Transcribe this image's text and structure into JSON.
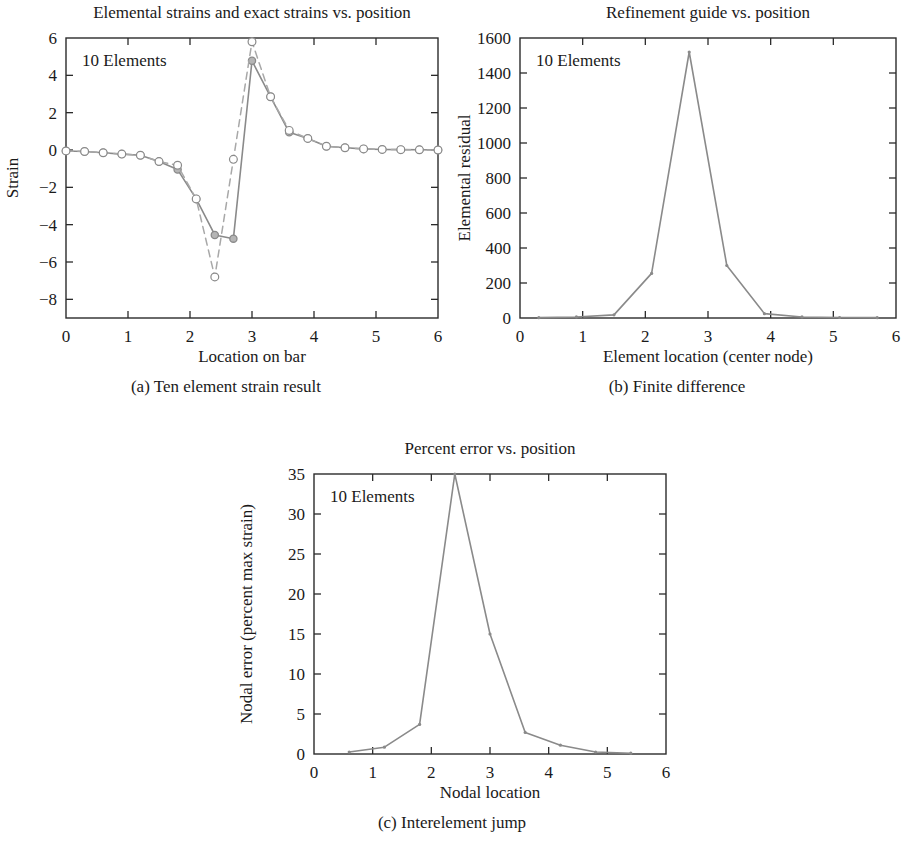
{
  "figure": {
    "panels": [
      {
        "id": "a",
        "title": "Elemental strains and exact strains vs. position",
        "annotation": "10 Elements",
        "xlabel": "Location on bar",
        "ylabel": "Strain",
        "caption": "(a) Ten element strain result"
      },
      {
        "id": "b",
        "title": "Refinement guide vs. position",
        "annotation": "10 Elements",
        "xlabel": "Element location (center node)",
        "ylabel": "Elemental residual",
        "caption": "(b) Finite difference"
      },
      {
        "id": "c",
        "title": "Percent error vs. position",
        "annotation": "10 Elements",
        "xlabel": "Nodal location",
        "ylabel": "Nodal error (percent max strain)",
        "caption": "(c) Interelement jump"
      }
    ]
  },
  "colors": {
    "axis": "#2b2b2b",
    "series_solid": "#8a8a8a",
    "series_dashed": "#a8a8a8",
    "marker_fill": "#b5b5b5",
    "marker_stroke": "#8a8a8a",
    "background": "#ffffff"
  },
  "chart_data": [
    {
      "type": "line",
      "panel": "a",
      "title": "Elemental strains and exact strains vs. position",
      "xlabel": "Location on bar",
      "ylabel": "Strain",
      "annotation": "10 Elements",
      "caption": "(a) Ten element strain result",
      "xlim": [
        0,
        6
      ],
      "ylim": [
        -9,
        6
      ],
      "xticks": [
        0,
        1,
        2,
        3,
        4,
        5,
        6
      ],
      "yticks": [
        -8,
        -6,
        -4,
        -2,
        0,
        2,
        4,
        6
      ],
      "grid": false,
      "legend": "none",
      "series": [
        {
          "name": "Elemental strains",
          "style": "solid",
          "marker": "filled-circle",
          "x": [
            0.0,
            0.3,
            0.6,
            0.9,
            1.2,
            1.5,
            1.8,
            2.1,
            2.4,
            2.7,
            3.0,
            3.3,
            3.6,
            3.9,
            4.2,
            4.5,
            4.8,
            5.1,
            5.4,
            5.7,
            6.0
          ],
          "y": [
            -0.05,
            -0.08,
            -0.15,
            -0.22,
            -0.28,
            -0.62,
            -1.05,
            -2.62,
            -4.55,
            -4.75,
            4.78,
            2.85,
            0.95,
            0.62,
            0.2,
            0.12,
            0.06,
            0.03,
            0.02,
            0.01,
            0.0
          ]
        },
        {
          "name": "Exact strains",
          "style": "dashed",
          "marker": "open-circle",
          "x": [
            0.0,
            0.3,
            0.6,
            0.9,
            1.2,
            1.5,
            1.8,
            2.1,
            2.4,
            2.7,
            3.0,
            3.3,
            3.6,
            3.9,
            4.2,
            4.5,
            4.8,
            5.1,
            5.4,
            5.7,
            6.0
          ],
          "y": [
            -0.05,
            -0.08,
            -0.15,
            -0.22,
            -0.28,
            -0.62,
            -0.82,
            -2.62,
            -6.8,
            -0.5,
            5.8,
            2.85,
            1.05,
            0.62,
            0.2,
            0.12,
            0.06,
            0.03,
            0.02,
            0.01,
            0.0
          ]
        }
      ]
    },
    {
      "type": "line",
      "panel": "b",
      "title": "Refinement guide vs. position",
      "xlabel": "Element location (center node)",
      "ylabel": "Elemental residual",
      "annotation": "10 Elements",
      "caption": "(b) Finite difference",
      "xlim": [
        0,
        6
      ],
      "ylim": [
        0,
        1600
      ],
      "xticks": [
        0,
        1,
        2,
        3,
        4,
        5,
        6
      ],
      "yticks": [
        0,
        200,
        400,
        600,
        800,
        1000,
        1200,
        1400,
        1600
      ],
      "grid": false,
      "legend": "none",
      "series": [
        {
          "name": "Elemental residual",
          "style": "solid",
          "marker": "dot",
          "x": [
            0.3,
            0.9,
            1.5,
            2.1,
            2.7,
            3.3,
            3.9,
            4.5,
            5.1,
            5.7
          ],
          "y": [
            2,
            6,
            18,
            255,
            1520,
            300,
            25,
            6,
            3,
            2
          ]
        }
      ]
    },
    {
      "type": "line",
      "panel": "c",
      "title": "Percent error vs. position",
      "xlabel": "Nodal location",
      "ylabel": "Nodal error (percent max strain)",
      "annotation": "10 Elements",
      "caption": "(c) Interelement jump",
      "xlim": [
        0,
        6
      ],
      "ylim": [
        0,
        35
      ],
      "xticks": [
        0,
        1,
        2,
        3,
        4,
        5,
        6
      ],
      "yticks": [
        0,
        5,
        10,
        15,
        20,
        25,
        30,
        35
      ],
      "grid": false,
      "legend": "none",
      "series": [
        {
          "name": "Nodal error",
          "style": "solid",
          "marker": "dot",
          "x": [
            0.6,
            1.2,
            1.8,
            2.4,
            3.0,
            3.6,
            4.2,
            4.8,
            5.4
          ],
          "y": [
            0.25,
            0.85,
            3.7,
            35.0,
            15.0,
            2.7,
            1.1,
            0.25,
            0.1
          ]
        }
      ]
    }
  ]
}
